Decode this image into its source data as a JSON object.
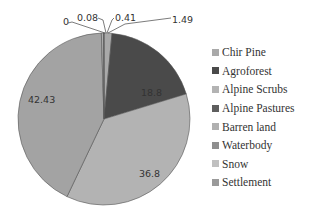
{
  "chart_data": {
    "type": "pie",
    "title": "",
    "categories": [
      "Chir Pine",
      "Agroforest",
      "Alpine Scrubs",
      "Alpine Pastures",
      "Barren land",
      "Waterbody",
      "Snow",
      "Settlement"
    ],
    "values": [
      1.49,
      18.8,
      36.8,
      42.43,
      0.41,
      0.08,
      0,
      null
    ],
    "data_labels": [
      "1.49",
      "18.8",
      "36.8",
      "42.43",
      "0.41",
      "0.08",
      "0"
    ],
    "colors": [
      "#a9a9a9",
      "#4a4a4a",
      "#b3b3b3",
      "#a3a3a3",
      "#b0b0b0",
      "#8f8f8f",
      "#c0c0c0",
      "#9a9a9a"
    ],
    "legend_position": "right",
    "start_angle_deg": 0,
    "direction": "clockwise"
  },
  "legend": {
    "items": [
      {
        "label": "Chir Pine",
        "color": "#a9a9a9"
      },
      {
        "label": "Agroforest",
        "color": "#4a4a4a"
      },
      {
        "label": "Alpine Scrubs",
        "color": "#b3b3b3"
      },
      {
        "label": "Alpine Pastures",
        "color": "#5e5e5e"
      },
      {
        "label": "Barren land",
        "color": "#b0b0b0"
      },
      {
        "label": "Waterbody",
        "color": "#8f8f8f"
      },
      {
        "label": "Snow",
        "color": "#c0c0c0"
      },
      {
        "label": "Settlement",
        "color": "#9a9a9a"
      }
    ]
  }
}
